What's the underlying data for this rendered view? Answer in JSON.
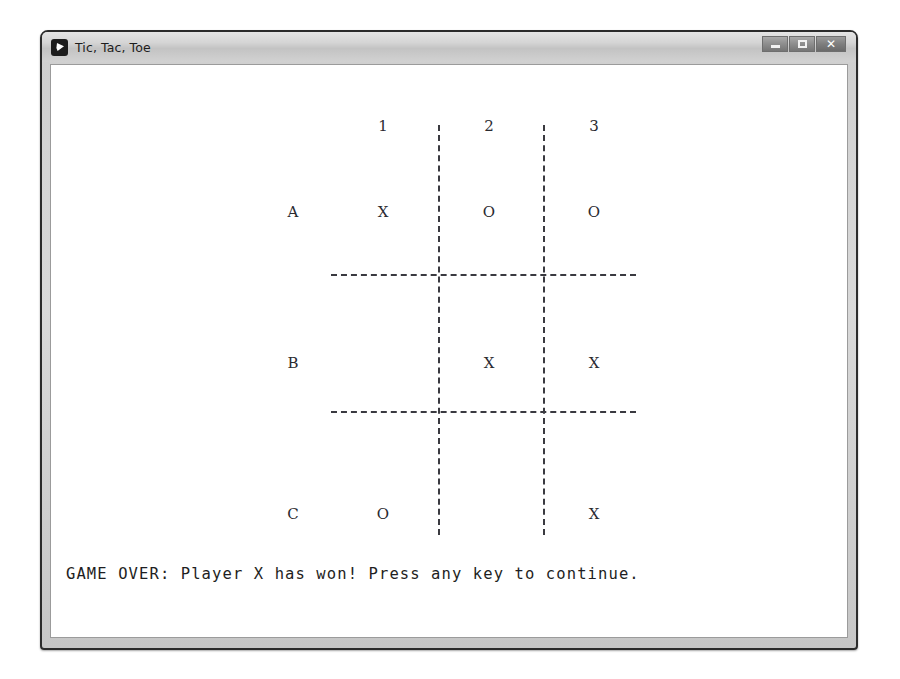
{
  "window": {
    "title": "Tic, Tac, Toe",
    "app_icon": "play-badge-icon",
    "buttons": {
      "minimize": "minimize-icon",
      "maximize": "maximize-icon",
      "close": "✕"
    }
  },
  "board": {
    "column_headers": [
      "1",
      "2",
      "3"
    ],
    "row_labels": [
      "A",
      "B",
      "C"
    ],
    "cells": [
      [
        "X",
        "O",
        "O"
      ],
      [
        "",
        "X",
        "X"
      ],
      [
        "O",
        "",
        "X"
      ]
    ]
  },
  "status": {
    "message": "GAME OVER: Player X has won! Press any key to continue."
  },
  "colors": {
    "ink": "#26262b",
    "grid": "#3a3a40",
    "window_frame": "#2b2b2b",
    "titlebar": "#d2d2d2",
    "client_background": "#ffffff"
  }
}
